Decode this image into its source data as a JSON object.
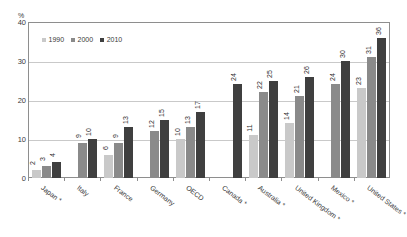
{
  "chart_data": {
    "type": "bar",
    "title": "",
    "subtitle": "",
    "xlabel": "",
    "ylabel": "",
    "yunit": "%",
    "ylim": [
      0,
      40
    ],
    "yticks": [
      0,
      10,
      20,
      30,
      40
    ],
    "grid": true,
    "legend_position": "top-left",
    "categories": [
      "Japan *",
      "Italy",
      "France",
      "Germany",
      "OECD",
      "Canada *",
      "Australia *",
      "United Kingdom *",
      "Mexico *",
      "United States *"
    ],
    "series": [
      {
        "name": "1990",
        "color": "#c9c9c9",
        "values": [
          2,
          null,
          6,
          null,
          10,
          null,
          11,
          14,
          null,
          23
        ]
      },
      {
        "name": "2000",
        "color": "#8a8a8a",
        "values": [
          3,
          9,
          9,
          12,
          13,
          null,
          22,
          21,
          24,
          31
        ]
      },
      {
        "name": "2010",
        "color": "#3f3f3f",
        "values": [
          4,
          10,
          13,
          15,
          17,
          24,
          25,
          26,
          30,
          36
        ]
      }
    ]
  },
  "axis": {
    "unit_label": "%",
    "tick_labels": [
      "40",
      "30",
      "20",
      "10",
      "0"
    ]
  },
  "colors": {
    "series_1990": "#c9c9c9",
    "series_2000": "#8a8a8a",
    "series_2010": "#3f3f3f",
    "frame": "#8e8e8e",
    "gridline": "#c9c9c9",
    "text": "#3a3a3a",
    "background": "#ffffff"
  }
}
